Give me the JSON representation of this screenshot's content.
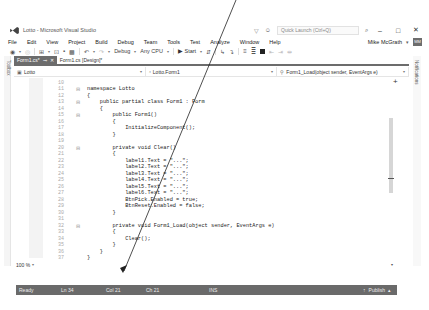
{
  "window": {
    "title": "Lotto - Microsoft Visual Studio",
    "quick_launch_placeholder": "Quick Launch (Ctrl+Q)",
    "controls": {
      "minimize": "‒",
      "maximize": "□",
      "close": "✕"
    }
  },
  "menubar": {
    "items": [
      "File",
      "Edit",
      "View",
      "Project",
      "Build",
      "Debug",
      "Team",
      "Tools",
      "Test",
      "Analyze",
      "Window",
      "Help"
    ],
    "user": "Mike McGrath",
    "avatar": "MM"
  },
  "toolbar": {
    "configuration": "Debug",
    "platform": "Any CPU",
    "start_label": "Start"
  },
  "side_panels": {
    "left": "Toolbox",
    "right": "Notifications"
  },
  "tabs": [
    {
      "label": "Form1.cs*",
      "active": true
    },
    {
      "label": "Form1.cs [Design]*",
      "active": false
    }
  ],
  "navbar": {
    "project": "Lotto",
    "class": "Lotto.Form1",
    "member": "Form1_Load(object sender, EventArgs e)"
  },
  "code": {
    "lines": [
      {
        "n": "10",
        "fold": "",
        "text": ""
      },
      {
        "n": "11",
        "fold": "⊟",
        "text": "namespace Lotto"
      },
      {
        "n": "12",
        "fold": "",
        "text": "{"
      },
      {
        "n": "13",
        "fold": "⊟",
        "text": "    public partial class Form1 : Form"
      },
      {
        "n": "14",
        "fold": "",
        "text": "    {"
      },
      {
        "n": "15",
        "fold": "⊟",
        "text": "        public Form1()"
      },
      {
        "n": "16",
        "fold": "",
        "text": "        {"
      },
      {
        "n": "17",
        "fold": "",
        "text": "            InitializeComponent();"
      },
      {
        "n": "18",
        "fold": "",
        "text": "        }"
      },
      {
        "n": "19",
        "fold": "",
        "text": ""
      },
      {
        "n": "20",
        "fold": "⊟",
        "text": "        private void Clear()"
      },
      {
        "n": "21",
        "fold": "",
        "text": "        {"
      },
      {
        "n": "22",
        "fold": "",
        "text": "            label1.Text = \"...\";"
      },
      {
        "n": "23",
        "fold": "",
        "text": "            label2.Text = \"...\";"
      },
      {
        "n": "24",
        "fold": "",
        "text": "            label3.Text = \"...\";"
      },
      {
        "n": "25",
        "fold": "",
        "text": "            label4.Text = \"...\";"
      },
      {
        "n": "26",
        "fold": "",
        "text": "            label5.Text = \"...\";"
      },
      {
        "n": "27",
        "fold": "",
        "text": "            label6.Text = \"...\";"
      },
      {
        "n": "28",
        "fold": "",
        "text": "            BtnPick.Enabled = true;"
      },
      {
        "n": "29",
        "fold": "",
        "text": "            BtnReset.Enabled = false;"
      },
      {
        "n": "30",
        "fold": "",
        "text": "        }"
      },
      {
        "n": "31",
        "fold": "",
        "text": ""
      },
      {
        "n": "32",
        "fold": "⊟",
        "text": "        private void Form1_Load(object sender, EventArgs e)"
      },
      {
        "n": "33",
        "fold": "",
        "text": "        {"
      },
      {
        "n": "34",
        "fold": "",
        "text": "            Clear();"
      },
      {
        "n": "35",
        "fold": "",
        "text": "        }"
      },
      {
        "n": "36",
        "fold": "",
        "text": "    }"
      },
      {
        "n": "37",
        "fold": "",
        "text": "}"
      }
    ]
  },
  "editor": {
    "zoom": "100 %"
  },
  "statusbar": {
    "state": "Ready",
    "line": "Ln 34",
    "col": "Col 21",
    "ch": "Ch 21",
    "mode": "INS",
    "publish": "Publish"
  }
}
